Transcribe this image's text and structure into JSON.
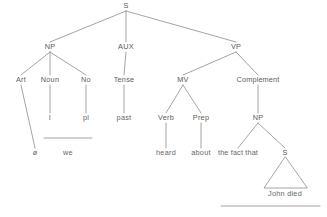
{
  "figure": {
    "kind": "syntax-tree-diagram",
    "title": "",
    "ink_color": "#5d5d5d",
    "line_color": "#8d8d8d",
    "background": "#ffffff",
    "width": 327,
    "height": 217
  },
  "nodes": {
    "root_s": "S",
    "np": "NP",
    "aux": "AUX",
    "vp": "VP",
    "art": "Art",
    "noun": "Noun",
    "no": "No",
    "tense": "Tense",
    "mv": "MV",
    "complement": "Complement",
    "noun_i": "I",
    "no_pl": "pl",
    "tense_past": "past",
    "verb": "Verb",
    "prep": "Prep",
    "comp_np": "NP",
    "art_null": "ø",
    "np_we": "we",
    "verb_heard": "heard",
    "prep_about": "about",
    "np_the_fact_that": "the fact that",
    "embedded_s": "S",
    "embedded_terminal": "John  died"
  },
  "tree": {
    "label": "S",
    "children": [
      {
        "label": "NP",
        "children": [
          {
            "label": "Art",
            "children": [
              {
                "label": "ø"
              }
            ]
          },
          {
            "label": "Noun",
            "children": [
              {
                "label": "I"
              }
            ]
          },
          {
            "label": "No",
            "children": [
              {
                "label": "pl"
              }
            ]
          }
        ],
        "derived_form": "we"
      },
      {
        "label": "AUX",
        "children": [
          {
            "label": "Tense",
            "children": [
              {
                "label": "past"
              }
            ]
          }
        ]
      },
      {
        "label": "VP",
        "children": [
          {
            "label": "MV",
            "children": [
              {
                "label": "Verb",
                "children": [
                  {
                    "label": "heard"
                  }
                ]
              },
              {
                "label": "Prep",
                "children": [
                  {
                    "label": "about"
                  }
                ]
              }
            ]
          },
          {
            "label": "Complement",
            "children": [
              {
                "label": "NP",
                "children": [
                  {
                    "label": "the fact that"
                  },
                  {
                    "label": "S",
                    "triangle": true,
                    "children": [
                      {
                        "label": "John  died"
                      }
                    ]
                  }
                ]
              }
            ]
          }
        ]
      }
    ]
  }
}
